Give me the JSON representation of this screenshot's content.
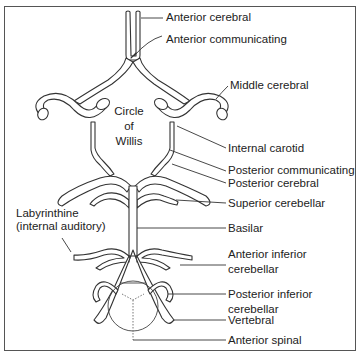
{
  "diagram": {
    "title": "Circle of Willis",
    "center_label_lines": [
      "Circle",
      "of",
      "Willis"
    ],
    "labels": {
      "anterior_cerebral": "Anterior cerebral",
      "anterior_communicating": "Anterior communicating",
      "middle_cerebral": "Middle cerebral",
      "internal_carotid": "Internal carotid",
      "posterior_communicating": "Posterior communicating",
      "posterior_cerebral": "Posterior cerebral",
      "superior_cerebellar": "Superior cerebellar",
      "basilar": "Basilar",
      "labyrinthine_1": "Labyrinthine",
      "labyrinthine_2": "(internal auditory)",
      "anterior_inferior_cerebellar_1": "Anterior inferior",
      "anterior_inferior_cerebellar_2": "cerebellar",
      "posterior_inferior_cerebellar_1": "Posterior inferior",
      "posterior_inferior_cerebellar_2": "cerebellar",
      "vertebral": "Vertebral",
      "anterior_spinal": "Anterior spinal"
    },
    "colors": {
      "line": "#333333",
      "frame": "#555555",
      "background": "#ffffff"
    }
  }
}
